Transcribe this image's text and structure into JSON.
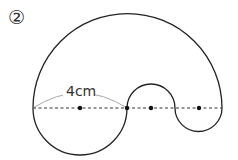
{
  "problem_number": "②",
  "dimension_label": "4cm",
  "colors": {
    "stroke": "#222222",
    "measure_arc": "#aaaaaa",
    "background": "#ffffff"
  },
  "figure": {
    "baseline_y": 108,
    "left_x": 33,
    "right_x": 222,
    "centers_x": [
      80,
      127,
      151,
      199
    ]
  }
}
